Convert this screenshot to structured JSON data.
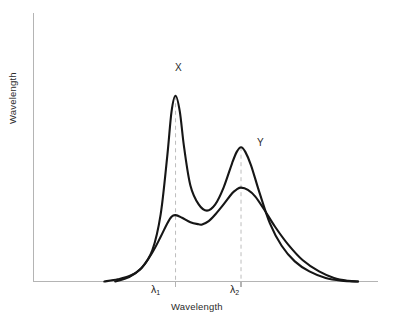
{
  "chart_data": {
    "type": "line",
    "title": "",
    "xlabel": "Wavelength",
    "ylabel": "Wavelength",
    "grid": false,
    "legend_position": "inline-annotations",
    "xlim": [
      0,
      1
    ],
    "ylim": [
      0,
      1
    ],
    "tick_labels": {
      "x": [
        "λ₁",
        "λ₂"
      ],
      "y": []
    },
    "annotations": [
      {
        "text": "X",
        "series": "X",
        "x": 0.44,
        "y": 0.82
      },
      {
        "text": "Y",
        "series": "Y",
        "x": 0.66,
        "y": 0.55
      }
    ],
    "reference_lines": [
      {
        "label": "λ₁",
        "x": 0.362,
        "style": "dashed"
      },
      {
        "label": "λ₂",
        "x": 0.591,
        "style": "dashed"
      }
    ],
    "series": [
      {
        "name": "X",
        "color": "#161616",
        "description": "Strong peak at lambda-1, secondary peak at lambda-2",
        "peaks": [
          {
            "at": "λ₁",
            "x": 0.362,
            "y": 0.831
          },
          {
            "at": "λ₂",
            "x": 0.591,
            "y": 0.601
          }
        ],
        "valleys": [
          {
            "x": 0.472,
            "y": 0.317
          }
        ],
        "x": [
          0.113,
          0.16,
          0.203,
          0.243,
          0.281,
          0.31,
          0.333,
          0.348,
          0.362,
          0.377,
          0.392,
          0.414,
          0.443,
          0.472,
          0.501,
          0.53,
          0.56,
          0.576,
          0.591,
          0.606,
          0.626,
          0.655,
          0.692,
          0.733,
          0.779,
          0.83,
          0.887,
          0.942,
          1.0
        ],
        "y": [
          0.0,
          0.01,
          0.026,
          0.06,
          0.14,
          0.3,
          0.56,
          0.76,
          0.831,
          0.76,
          0.6,
          0.43,
          0.345,
          0.317,
          0.345,
          0.42,
          0.53,
          0.58,
          0.601,
          0.58,
          0.52,
          0.4,
          0.26,
          0.16,
          0.09,
          0.045,
          0.016,
          0.004,
          0.0
        ]
      },
      {
        "name": "Y",
        "color": "#161616",
        "description": "Broad shoulder at lambda-1, main peak at lambda-2",
        "peaks": [
          {
            "at": "λ₁",
            "x": 0.362,
            "y": 0.297
          },
          {
            "at": "λ₂",
            "x": 0.591,
            "y": 0.42
          }
        ],
        "valleys": [
          {
            "x": 0.455,
            "y": 0.255
          }
        ],
        "crossing_with_x": {
          "x": 0.519,
          "y": 0.393
        },
        "x": [
          0.151,
          0.2,
          0.243,
          0.281,
          0.31,
          0.333,
          0.348,
          0.362,
          0.385,
          0.414,
          0.443,
          0.455,
          0.478,
          0.501,
          0.53,
          0.56,
          0.576,
          0.591,
          0.615,
          0.641,
          0.673,
          0.71,
          0.756,
          0.807,
          0.864,
          0.916,
          0.965,
          1.0
        ],
        "y": [
          0.0,
          0.02,
          0.06,
          0.13,
          0.2,
          0.26,
          0.29,
          0.297,
          0.285,
          0.265,
          0.256,
          0.255,
          0.27,
          0.3,
          0.345,
          0.395,
          0.412,
          0.42,
          0.41,
          0.38,
          0.32,
          0.245,
          0.165,
          0.095,
          0.045,
          0.016,
          0.003,
          0.0
        ]
      }
    ]
  },
  "axes": {
    "y_axis_label": "Wavelength",
    "x_axis_label": "Wavelength",
    "tick_1": "λ",
    "tick_1_sub": "1",
    "tick_2": "λ",
    "tick_2_sub": "2"
  },
  "curve_labels": {
    "x": "X",
    "y": "Y"
  },
  "colors": {
    "curve": "#161616",
    "axis": "#b4b4b4",
    "guide": "#bdbdbd",
    "text": "#2b2b2b",
    "background": "#ffffff"
  }
}
